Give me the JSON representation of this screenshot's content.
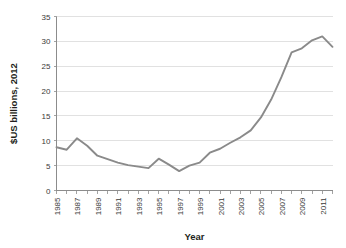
{
  "chart_data": {
    "type": "line",
    "title": "",
    "xlabel": "Year",
    "ylabel": "$US billions, 2012",
    "xlim": [
      1985,
      2012
    ],
    "ylim": [
      0,
      35
    ],
    "yticks": [
      0,
      5,
      10,
      15,
      20,
      25,
      30,
      35
    ],
    "ytick_labels": [
      "0",
      "5",
      "10",
      "15",
      "20",
      "25",
      "30",
      "35"
    ],
    "xticks": [
      1985,
      1986,
      1987,
      1988,
      1989,
      1990,
      1991,
      1992,
      1993,
      1994,
      1995,
      1996,
      1997,
      1998,
      1999,
      2000,
      2001,
      2002,
      2003,
      2004,
      2005,
      2006,
      2007,
      2008,
      2009,
      2010,
      2011,
      2012
    ],
    "xtick_labels": [
      "1985",
      "",
      "1987",
      "",
      "1989",
      "",
      "1991",
      "",
      "1993",
      "",
      "1995",
      "",
      "1997",
      "",
      "1999",
      "",
      "2001",
      "",
      "2003",
      "",
      "2005",
      "",
      "2007",
      "",
      "2009",
      "",
      "2011",
      ""
    ],
    "grid": true,
    "grid_axis": "y",
    "legend": false,
    "legend_position": "none",
    "line_color": "#8a8a8a",
    "series": [
      {
        "name": "$US billions, 2012",
        "x": [
          1985,
          1986,
          1987,
          1988,
          1989,
          1990,
          1991,
          1992,
          1993,
          1994,
          1995,
          1996,
          1997,
          1998,
          1999,
          2000,
          2001,
          2002,
          2003,
          2004,
          2005,
          2006,
          2007,
          2008,
          2009,
          2010,
          2011,
          2012
        ],
        "values": [
          8.7,
          8.2,
          10.5,
          9.0,
          7.0,
          6.3,
          5.6,
          5.1,
          4.8,
          4.5,
          6.4,
          5.2,
          3.9,
          5.0,
          5.6,
          7.6,
          8.4,
          9.6,
          10.7,
          12.1,
          14.7,
          18.3,
          22.8,
          27.8,
          28.6,
          30.2,
          31.0,
          28.9
        ]
      }
    ]
  }
}
